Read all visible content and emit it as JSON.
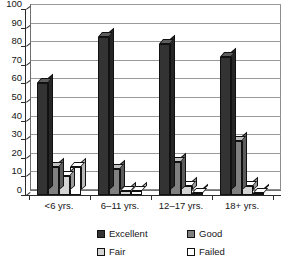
{
  "chart_data": {
    "type": "bar",
    "title": "",
    "subtitle": "",
    "xlabel": "",
    "ylabel": "",
    "categories": [
      "<6 yrs.",
      "6–11 yrs.",
      "12–17 yrs.",
      "18+ yrs."
    ],
    "series": [
      {
        "name": "Excellent",
        "color": "#333333",
        "values": [
          60,
          85,
          81,
          74
        ]
      },
      {
        "name": "Good",
        "color": "#808080",
        "values": [
          15,
          14,
          18,
          29
        ]
      },
      {
        "name": "Fair",
        "color": "#d4d4d4",
        "values": [
          10,
          2,
          5,
          5
        ]
      },
      {
        "name": "Failed",
        "color": "#ffffff",
        "values": [
          15,
          2,
          1,
          1
        ]
      }
    ],
    "ylim": [
      0,
      100
    ],
    "yticks": [
      0,
      10,
      20,
      30,
      40,
      50,
      60,
      70,
      80,
      90,
      100
    ],
    "ytick_labels": [
      "0",
      "10",
      "20",
      "30",
      "40",
      "50",
      "60",
      "70",
      "80",
      "90",
      "100"
    ],
    "grid": true,
    "grid_axis": "y",
    "legend_position": "bottom",
    "style": "3d-column"
  },
  "legend": {
    "items": [
      {
        "label": "Excellent",
        "color": "#333333"
      },
      {
        "label": "Fair",
        "color": "#d4d4d4"
      },
      {
        "label": "Good",
        "color": "#808080"
      },
      {
        "label": "Failed",
        "color": "#ffffff"
      }
    ]
  }
}
